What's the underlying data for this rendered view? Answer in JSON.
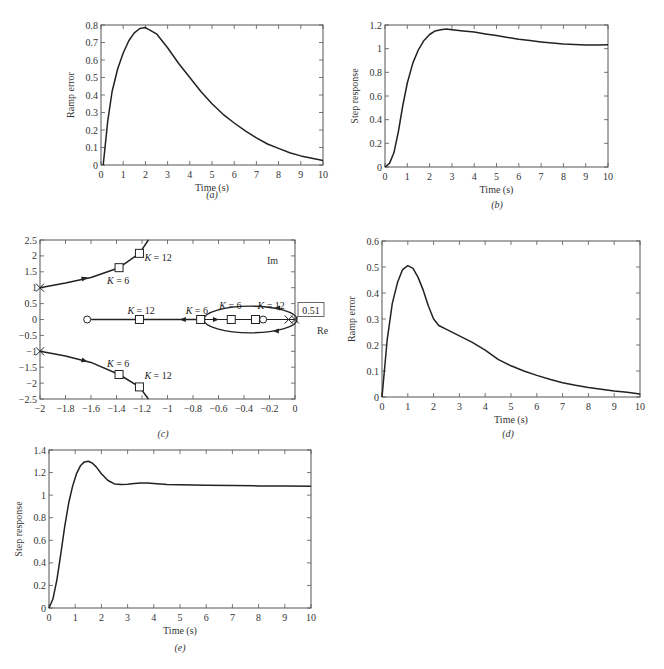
{
  "chart_data": [
    {
      "id": "a",
      "type": "line",
      "caption": "(a)",
      "xlabel": "Time (s)",
      "ylabel": "Ramp error",
      "xlim": [
        0,
        10
      ],
      "ylim": [
        0,
        0.8
      ],
      "xticks": [
        0,
        1,
        2,
        3,
        4,
        5,
        6,
        7,
        8,
        9,
        10
      ],
      "yticks": [
        0,
        0.1,
        0.2,
        0.3,
        0.4,
        0.5,
        0.6,
        0.7,
        0.8
      ],
      "grid": false,
      "series": [
        {
          "name": "ramp error",
          "x": [
            0.1,
            0.3,
            0.5,
            0.75,
            1,
            1.25,
            1.5,
            1.75,
            2,
            2.5,
            3,
            3.5,
            4,
            4.5,
            5,
            5.5,
            6,
            6.5,
            7,
            7.5,
            8,
            8.5,
            9,
            9.5,
            10
          ],
          "y": [
            0,
            0.25,
            0.42,
            0.55,
            0.64,
            0.71,
            0.755,
            0.78,
            0.785,
            0.75,
            0.67,
            0.58,
            0.5,
            0.42,
            0.35,
            0.29,
            0.24,
            0.195,
            0.155,
            0.12,
            0.095,
            0.07,
            0.052,
            0.038,
            0.025
          ]
        }
      ]
    },
    {
      "id": "b",
      "type": "line",
      "caption": "(b)",
      "xlabel": "Time (s)",
      "ylabel": "Step response",
      "xlim": [
        0,
        10
      ],
      "ylim": [
        0,
        1.2
      ],
      "xticks": [
        0,
        1,
        2,
        3,
        4,
        5,
        6,
        7,
        8,
        9,
        10
      ],
      "yticks": [
        0,
        0.2,
        0.4,
        0.6,
        0.8,
        1,
        1.2
      ],
      "grid": false,
      "series": [
        {
          "name": "step response",
          "x": [
            0,
            0.2,
            0.4,
            0.6,
            0.8,
            1,
            1.25,
            1.5,
            1.75,
            2,
            2.25,
            2.5,
            2.75,
            3,
            3.5,
            4,
            4.5,
            5,
            5.5,
            6,
            6.5,
            7,
            7.5,
            8,
            8.5,
            9,
            9.5,
            10
          ],
          "y": [
            0,
            0.03,
            0.12,
            0.3,
            0.52,
            0.71,
            0.88,
            0.99,
            1.07,
            1.12,
            1.15,
            1.16,
            1.165,
            1.16,
            1.15,
            1.14,
            1.125,
            1.11,
            1.095,
            1.08,
            1.068,
            1.057,
            1.048,
            1.04,
            1.035,
            1.032,
            1.032,
            1.033
          ]
        }
      ]
    },
    {
      "id": "c",
      "type": "line",
      "subtype": "root-locus",
      "caption": "(c)",
      "xlabel": "Re",
      "ylabel": "Im",
      "xlim": [
        -2,
        0
      ],
      "ylim": [
        -2.5,
        2.5
      ],
      "xticks": [
        -2,
        -1.8,
        -1.6,
        -1.4,
        -1.2,
        -1,
        -0.8,
        -0.6,
        -0.4,
        -0.2,
        0
      ],
      "yticks": [
        -2.5,
        -2,
        -1.5,
        -1,
        -0.5,
        0,
        0.5,
        1,
        1.5,
        2,
        2.5
      ],
      "grid": false,
      "poles": [
        [
          -2,
          1
        ],
        [
          -2,
          -1
        ],
        [
          -0.05,
          0
        ],
        [
          0,
          0
        ]
      ],
      "zeros": [
        [
          -1.63,
          0
        ],
        [
          -0.25,
          0
        ]
      ],
      "annotations": [
        {
          "text": "K = 12",
          "at": [
            -1.22,
            2.08
          ]
        },
        {
          "text": "K = 6",
          "at": [
            -1.38,
            1.63
          ]
        },
        {
          "text": "K = 12",
          "at": [
            -1.22,
            0
          ]
        },
        {
          "text": "K = 6",
          "at": [
            -0.74,
            0
          ]
        },
        {
          "text": "K = 6",
          "at": [
            -0.5,
            0
          ]
        },
        {
          "text": "K = 12",
          "at": [
            -0.31,
            0
          ]
        },
        {
          "text": "K = 6",
          "at": [
            -1.38,
            -1.73
          ]
        },
        {
          "text": "K = 12",
          "at": [
            -1.22,
            -2.12
          ]
        },
        {
          "text": "0.51",
          "at": [
            0,
            0
          ],
          "boxed": true
        }
      ],
      "series": [
        {
          "name": "upper branch",
          "x": [
            -2,
            -1.8,
            -1.6,
            -1.38,
            -1.22,
            -1.15
          ],
          "y": [
            1.0,
            1.15,
            1.32,
            1.63,
            2.08,
            2.5
          ]
        },
        {
          "name": "lower branch",
          "x": [
            -2,
            -1.8,
            -1.6,
            -1.38,
            -1.22,
            -1.15
          ],
          "y": [
            -1.0,
            -1.15,
            -1.35,
            -1.73,
            -2.12,
            -2.5
          ]
        },
        {
          "name": "real-axis branch",
          "x": [
            -1.6,
            -0.7
          ],
          "y": [
            0,
            0
          ]
        },
        {
          "name": "loop branch",
          "x": [
            -0.7,
            -0.6,
            -0.4,
            -0.2,
            0,
            -0.2,
            -0.4,
            -0.6,
            -0.7
          ],
          "y": [
            0,
            0.28,
            0.4,
            0.35,
            0,
            -0.35,
            -0.4,
            -0.28,
            0
          ]
        }
      ]
    },
    {
      "id": "d",
      "type": "line",
      "caption": "(d)",
      "xlabel": "Time (s)",
      "ylabel": "Ramp error",
      "xlim": [
        0,
        10
      ],
      "ylim": [
        0,
        0.6
      ],
      "xticks": [
        0,
        1,
        2,
        3,
        4,
        5,
        6,
        7,
        8,
        9,
        10
      ],
      "yticks": [
        0,
        0.1,
        0.2,
        0.3,
        0.4,
        0.5,
        0.6
      ],
      "grid": false,
      "series": [
        {
          "name": "ramp error",
          "x": [
            0,
            0.2,
            0.4,
            0.6,
            0.8,
            1,
            1.2,
            1.4,
            1.6,
            1.8,
            2,
            2.2,
            2.5,
            3,
            3.5,
            4,
            4.5,
            5,
            5.5,
            6,
            6.5,
            7,
            7.5,
            8,
            8.5,
            9,
            9.5,
            10
          ],
          "y": [
            0,
            0.22,
            0.36,
            0.44,
            0.49,
            0.505,
            0.495,
            0.46,
            0.41,
            0.35,
            0.3,
            0.275,
            0.26,
            0.235,
            0.21,
            0.18,
            0.145,
            0.12,
            0.1,
            0.083,
            0.068,
            0.055,
            0.045,
            0.037,
            0.03,
            0.023,
            0.018,
            0.012
          ]
        }
      ]
    },
    {
      "id": "e",
      "type": "line",
      "caption": "(e)",
      "xlabel": "Time (s)",
      "ylabel": "Step response",
      "xlim": [
        0,
        10
      ],
      "ylim": [
        0,
        1.4
      ],
      "xticks": [
        0,
        1,
        2,
        3,
        4,
        5,
        6,
        7,
        8,
        9,
        10
      ],
      "yticks": [
        0,
        0.2,
        0.4,
        0.6,
        0.8,
        1,
        1.2,
        1.4
      ],
      "grid": false,
      "series": [
        {
          "name": "step response",
          "x": [
            0,
            0.15,
            0.3,
            0.45,
            0.6,
            0.75,
            0.9,
            1.05,
            1.2,
            1.35,
            1.5,
            1.65,
            1.8,
            2,
            2.25,
            2.5,
            2.75,
            3,
            3.25,
            3.5,
            3.75,
            4,
            4.5,
            5,
            6,
            7,
            8,
            9,
            10
          ],
          "y": [
            0,
            0.08,
            0.25,
            0.48,
            0.72,
            0.93,
            1.08,
            1.19,
            1.26,
            1.295,
            1.3,
            1.285,
            1.25,
            1.19,
            1.13,
            1.1,
            1.095,
            1.097,
            1.102,
            1.107,
            1.108,
            1.103,
            1.095,
            1.092,
            1.088,
            1.085,
            1.082,
            1.08,
            1.078
          ]
        }
      ]
    }
  ]
}
